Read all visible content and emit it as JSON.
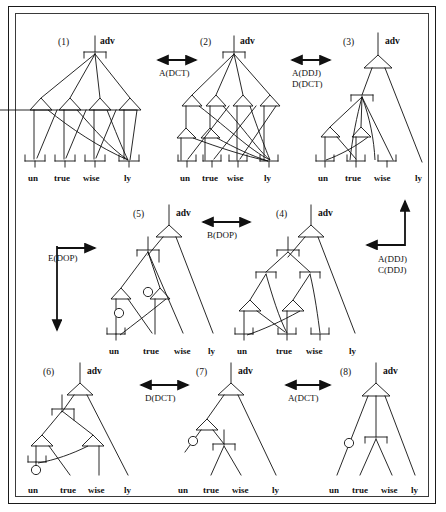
{
  "figure": {
    "title": "",
    "background": "#ffffff",
    "stroke_color": "#111111",
    "frame": {
      "outer": true,
      "inner": true
    }
  },
  "words": {
    "w1": "un",
    "w2": "true",
    "w3": "wise",
    "w4": "ly"
  },
  "root_label": "adv",
  "trees": [
    {
      "id": "t1",
      "number": "(1)",
      "root": "adv",
      "leaves": [
        "un",
        "true",
        "wise",
        "ly"
      ]
    },
    {
      "id": "t2",
      "number": "(2)",
      "root": "adv",
      "leaves": [
        "un",
        "true",
        "wise",
        "ly"
      ]
    },
    {
      "id": "t3",
      "number": "(3)",
      "root": "adv",
      "leaves": [
        "un",
        "true",
        "wise",
        "ly"
      ]
    },
    {
      "id": "t4",
      "number": "(4)",
      "root": "adv",
      "leaves": [
        "un",
        "true",
        "wise",
        "ly"
      ]
    },
    {
      "id": "t5",
      "number": "(5)",
      "root": "adv",
      "leaves": [
        "un",
        "true",
        "wise",
        "ly"
      ]
    },
    {
      "id": "t6",
      "number": "(6)",
      "root": "adv",
      "leaves": [
        "un",
        "true",
        "wise",
        "ly"
      ]
    },
    {
      "id": "t7",
      "number": "(7)",
      "root": "adv",
      "leaves": [
        "un",
        "true",
        "wise",
        "ly"
      ]
    },
    {
      "id": "t8",
      "number": "(8)",
      "root": "adv",
      "leaves": [
        "un",
        "true",
        "wise",
        "ly"
      ]
    }
  ],
  "operations": [
    {
      "id": "op_1_2",
      "label": "A(DCT)",
      "direction": "bidirectional-horizontal"
    },
    {
      "id": "op_2_3",
      "label_line1": "A(DDJ)",
      "label_line2": "D(DCT)",
      "direction": "bidirectional-horizontal"
    },
    {
      "id": "op_3_4",
      "label_line1": "A(DDJ)",
      "label_line2": "C(DDJ)",
      "direction": "elbow-left-up"
    },
    {
      "id": "op_4_5",
      "label": "B(DOP)",
      "direction": "bidirectional-horizontal"
    },
    {
      "id": "op_5_6",
      "label": "E(DOP)",
      "direction": "elbow-right-down"
    },
    {
      "id": "op_6_7",
      "label": "D(DCT)",
      "direction": "bidirectional-horizontal"
    },
    {
      "id": "op_7_8",
      "label": "A(DCT)",
      "direction": "bidirectional-horizontal"
    }
  ]
}
